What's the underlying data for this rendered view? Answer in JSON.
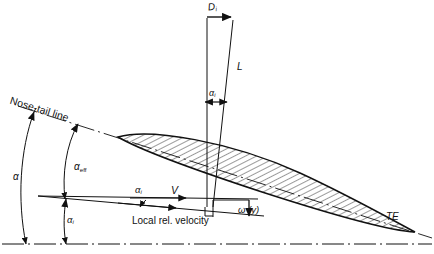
{
  "figure": {
    "type": "technical-diagram",
    "background_color": "#ffffff",
    "ink_color": "#111111"
  },
  "labels": {
    "induced_drag": "D",
    "induced_drag_sub": "i",
    "lift": "L",
    "alpha_i_upper": "α",
    "alpha_i_upper_sub": "i",
    "nose_tail_line": "Nose-tail line",
    "alpha": "α",
    "alpha_eff": "α",
    "alpha_eff_sub": "eff",
    "alpha_i_left": "α",
    "alpha_i_left_sub": "i",
    "alpha_i_mid": "α",
    "alpha_i_mid_sub": "i",
    "velocity": "V",
    "local_rel_velocity": "Local rel. velocity",
    "downwash": "ω (y)",
    "trailing_edge": "TE"
  },
  "geometry": {
    "airfoil": {
      "leading_edge": [
        118,
        137
      ],
      "trailing_edge": [
        415,
        232
      ],
      "chord_line_note": "nose-tail line, dash-dot"
    },
    "baseline_y": 244,
    "velocity_origin": [
      213,
      207
    ],
    "lift_tip": [
      210,
      16
    ],
    "drag_arrow": [
      [
        207,
        16
      ],
      [
        232,
        16
      ]
    ]
  }
}
